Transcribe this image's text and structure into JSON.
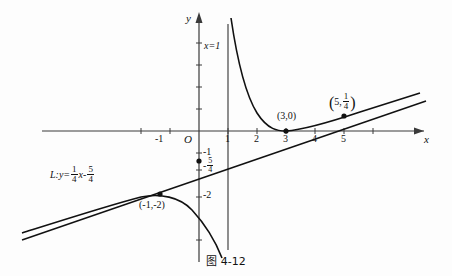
{
  "figure": {
    "caption": "图 4-12",
    "axes": {
      "x_label": "x",
      "y_label": "y",
      "origin_label": "O",
      "x_ticks": [
        {
          "value": -2,
          "label": ""
        },
        {
          "value": -1,
          "label": "-1"
        },
        {
          "value": 1,
          "label": "1"
        },
        {
          "value": 2,
          "label": "2"
        },
        {
          "value": 3,
          "label": "3"
        },
        {
          "value": 4,
          "label": "4"
        },
        {
          "value": 5,
          "label": "5"
        }
      ],
      "y_ticks": [
        {
          "value": -1,
          "label": "-1"
        },
        {
          "value": -1.25,
          "label": "-5/4"
        },
        {
          "value": -2,
          "label": "-2"
        }
      ],
      "x_range": [
        -2.9,
        6.6
      ],
      "y_range": [
        -3.6,
        5.2
      ]
    },
    "asymptote": {
      "label": "x=1",
      "equation_x": 1
    },
    "line": {
      "name": "L",
      "label_prefix": "L:y=",
      "slope_num": "1",
      "slope_den": "4",
      "slope_var": "x",
      "minus": "-",
      "intercept_num": "5",
      "intercept_den": "4",
      "slope_value": 0.25,
      "intercept_value": -1.25
    },
    "points": [
      {
        "name": "tangency",
        "label": "(3,0)",
        "x": 3,
        "y": 0
      },
      {
        "name": "intersection",
        "label_x": "5",
        "label_num": "1",
        "label_den": "4",
        "x": 5,
        "y": 0.25
      },
      {
        "name": "local-max",
        "label": "(-1,-2)",
        "x": -1,
        "y": -2
      },
      {
        "name": "y-intercept",
        "label": "",
        "x": 0,
        "y": -1.25
      }
    ],
    "colors": {
      "background": "#fdfdfd",
      "ink": "#111111",
      "axis": "#3a3a3a"
    }
  }
}
